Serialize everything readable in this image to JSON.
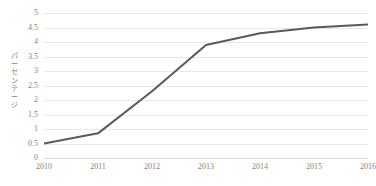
{
  "chart_data": {
    "type": "line",
    "title": "",
    "xlabel": "",
    "ylabel": "パーセンテージ",
    "categories": [
      "2010",
      "2011",
      "2012",
      "2013",
      "2014",
      "2015",
      "2016"
    ],
    "series": [
      {
        "name": "",
        "values": [
          0.5,
          0.85,
          2.3,
          3.9,
          4.3,
          4.5,
          4.6
        ]
      }
    ],
    "ylim": [
      0,
      5
    ],
    "ytick_step": 0.5,
    "yticks": [
      "0",
      "0.5",
      "1",
      "1.5",
      "2",
      "2.5",
      "3",
      "3.5",
      "4",
      "4.5",
      "5"
    ],
    "xticks": [
      "2010",
      "2011",
      "2012",
      "2013",
      "2014",
      "2015",
      "2016"
    ],
    "grid": "horizontal",
    "legend": "none",
    "line_color": "#595959",
    "gridline_color": "#e8e8e8",
    "tick_label_color": "#7f7f7f",
    "background_color": "#ffffff",
    "line_width": 2,
    "markers": "none"
  }
}
